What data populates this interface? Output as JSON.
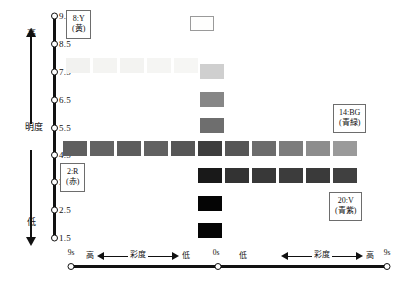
{
  "figure": {
    "type": "diagram"
  },
  "vertical_axis": {
    "name": "lightness-axis",
    "label": "明度",
    "high_label": "高",
    "low_label": "低",
    "ticks": [
      "9.5",
      "8.5",
      "7.5",
      "6.5",
      "5.5",
      "4.5",
      "3.5",
      "2.5",
      "1.5"
    ],
    "tick_y": [
      16,
      44,
      72,
      100,
      128,
      155,
      182,
      210,
      238
    ]
  },
  "horizontal_axis": {
    "name": "chroma-axis",
    "left_end_label": "9s",
    "center_label": "0s",
    "right_end_label": "9s",
    "left_high": "高",
    "left_low": "低",
    "right_low": "低",
    "right_high": "高",
    "caption_left": "彩度",
    "caption_right": "彩度"
  },
  "callouts": [
    {
      "id": "yellow",
      "code": "8:Y",
      "name": "(黄)",
      "x": 66,
      "y": 10
    },
    {
      "id": "blue-green",
      "code": "14:BG",
      "name": "(青緑)",
      "x": 333,
      "y": 104
    },
    {
      "id": "red",
      "code": "2:R",
      "name": "(赤)",
      "x": 60,
      "y": 163
    },
    {
      "id": "violet",
      "code": "20:V",
      "name": "(青紫)",
      "x": 329,
      "y": 192
    }
  ],
  "columns_x": [
    66,
    93,
    120,
    147,
    174,
    190,
    217,
    244,
    271,
    298,
    325,
    352,
    379
  ],
  "swatches": [
    {
      "row": "9.5",
      "col": 0,
      "x": 190,
      "y": 16,
      "color": "#fefefd",
      "outlined": true
    },
    {
      "row": "7.5",
      "col": -5,
      "x": 66,
      "y": 58,
      "color": "#f2f2f0",
      "outlined": false
    },
    {
      "row": "7.5",
      "col": -4,
      "x": 93,
      "y": 58,
      "color": "#f4f4f2",
      "outlined": false
    },
    {
      "row": "7.5",
      "col": -3,
      "x": 120,
      "y": 58,
      "color": "#f3f3f1",
      "outlined": false
    },
    {
      "row": "7.5",
      "col": -2,
      "x": 147,
      "y": 58,
      "color": "#f5f5f3",
      "outlined": false
    },
    {
      "row": "7.5",
      "col": -1,
      "x": 174,
      "y": 58,
      "color": "#f6f6f4",
      "outlined": false
    },
    {
      "row": "7.5",
      "col": 0,
      "x": 200,
      "y": 64,
      "color": "#cfcfcf",
      "outlined": false
    },
    {
      "row": "6.5",
      "col": 0,
      "x": 200,
      "y": 92,
      "color": "#868686",
      "outlined": false
    },
    {
      "row": "5.5",
      "col": 0,
      "x": 200,
      "y": 118,
      "color": "#6e6e6e",
      "outlined": false
    },
    {
      "row": "4.5",
      "col": -5,
      "x": 63,
      "y": 141,
      "color": "#5f5f5f",
      "outlined": false
    },
    {
      "row": "4.5",
      "col": -4,
      "x": 90,
      "y": 141,
      "color": "#636363",
      "outlined": false
    },
    {
      "row": "4.5",
      "col": -3,
      "x": 117,
      "y": 141,
      "color": "#5d5d5d",
      "outlined": false
    },
    {
      "row": "4.5",
      "col": -2,
      "x": 144,
      "y": 141,
      "color": "#616161",
      "outlined": false
    },
    {
      "row": "4.5",
      "col": -1,
      "x": 171,
      "y": 141,
      "color": "#565656",
      "outlined": false
    },
    {
      "row": "4.5",
      "col": 0,
      "x": 198,
      "y": 141,
      "color": "#3d3d3d",
      "outlined": false
    },
    {
      "row": "4.5",
      "col": 1,
      "x": 225,
      "y": 141,
      "color": "#565656",
      "outlined": false
    },
    {
      "row": "4.5",
      "col": 2,
      "x": 252,
      "y": 141,
      "color": "#6c6c6c",
      "outlined": false
    },
    {
      "row": "4.5",
      "col": 3,
      "x": 279,
      "y": 141,
      "color": "#7c7c7c",
      "outlined": false
    },
    {
      "row": "4.5",
      "col": 4,
      "x": 306,
      "y": 141,
      "color": "#8d8d8d",
      "outlined": false
    },
    {
      "row": "4.5",
      "col": 5,
      "x": 333,
      "y": 141,
      "color": "#9a9a9a",
      "outlined": false
    },
    {
      "row": "3.5",
      "col": 0,
      "x": 198,
      "y": 168,
      "color": "#191919",
      "outlined": false
    },
    {
      "row": "3.5",
      "col": 1,
      "x": 225,
      "y": 168,
      "color": "#333333",
      "outlined": false
    },
    {
      "row": "3.5",
      "col": 2,
      "x": 252,
      "y": 168,
      "color": "#383838",
      "outlined": false
    },
    {
      "row": "3.5",
      "col": 3,
      "x": 279,
      "y": 168,
      "color": "#3c3c3c",
      "outlined": false
    },
    {
      "row": "3.5",
      "col": 4,
      "x": 306,
      "y": 168,
      "color": "#3a3a3a",
      "outlined": false
    },
    {
      "row": "3.5",
      "col": 5,
      "x": 333,
      "y": 168,
      "color": "#404040",
      "outlined": false
    },
    {
      "row": "2.5",
      "col": 0,
      "x": 198,
      "y": 196,
      "color": "#050505",
      "outlined": false
    },
    {
      "row": "1.5",
      "col": 0,
      "x": 198,
      "y": 223,
      "color": "#050505",
      "outlined": false
    }
  ]
}
